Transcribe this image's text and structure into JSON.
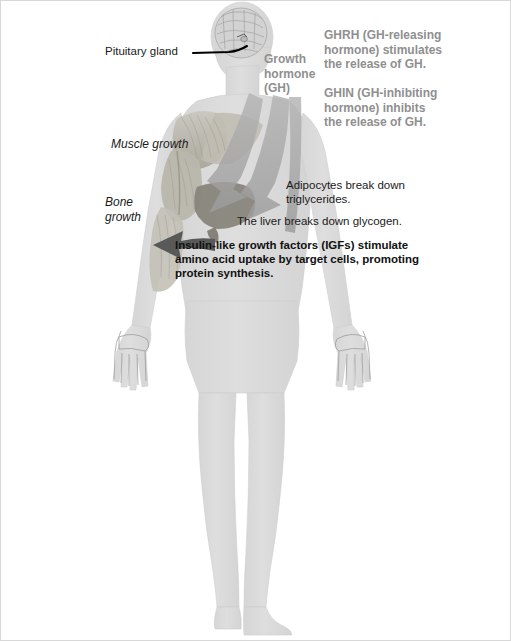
{
  "figure": {
    "background_color": "#ffffff",
    "border_color": "#d8d8d8",
    "width": 511,
    "height": 641
  },
  "labels": {
    "pituitary": "Pituitary gland",
    "growth_hormone": "Growth\nhormone\n(GH)",
    "ghrh": "GHRH (GH-releasing\nhormone) stimulates\nthe release of GH.",
    "ghin": "GHIN (GH-inhibiting\nhormone) inhibits\nthe release of GH.",
    "muscle_growth": "Muscle growth",
    "bone_growth": "Bone\ngrowth",
    "adipocytes": "Adipocytes break down\ntriglycerides.",
    "liver": "The liver breaks down glycogen.",
    "igf": "Insulin-like growth factors (IGFs) stimulate\namino acid uptake by target cells, promoting\nprotein synthesis."
  },
  "colors": {
    "body_silhouette": "#dcdcdc",
    "body_silhouette_edge": "#cfcfcf",
    "muscle_light": "#c9c6bd",
    "muscle_mid": "#b3afa4",
    "muscle_dark": "#8d8a80",
    "liver_organ": "#7d7a72",
    "brain": "#d2d2d2",
    "brain_outline": "#a8a8a8",
    "bone_outline": "#9a9a9a",
    "arrow_gray": "#a6a6a6",
    "arrow_dark": "#595959",
    "leader_line": "#000000",
    "text_dark": "#1a1a1a",
    "text_gray_label": "#8f8f8f"
  },
  "annotations": [
    {
      "name": "pituitary-gland",
      "kind": "leader-label",
      "target": "pituitary gland in brain"
    },
    {
      "name": "growth-hormone",
      "kind": "pathway-label",
      "target": "GH secretion arrows"
    },
    {
      "name": "ghrh",
      "kind": "text-block",
      "target": "hypothalamic stimulation"
    },
    {
      "name": "ghin",
      "kind": "text-block",
      "target": "hypothalamic inhibition"
    },
    {
      "name": "muscle-growth",
      "kind": "effect-label",
      "target": "skeletal muscle"
    },
    {
      "name": "bone-growth",
      "kind": "effect-label",
      "target": "long bone"
    },
    {
      "name": "adipocytes",
      "kind": "effect-text",
      "target": "adipose tissue"
    },
    {
      "name": "liver",
      "kind": "effect-text",
      "target": "liver"
    },
    {
      "name": "igf",
      "kind": "effect-text-bold",
      "target": "target cells"
    }
  ]
}
